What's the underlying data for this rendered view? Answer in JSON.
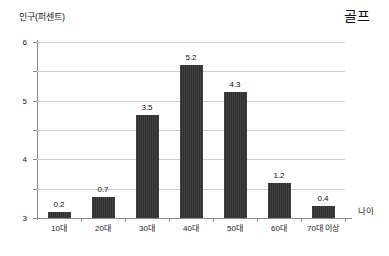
{
  "chart_data": {
    "type": "bar",
    "title": "골프",
    "subtitle": "",
    "xlabel": "나이",
    "ylabel": "인구(퍼센트)",
    "categories": [
      "10대",
      "20대",
      "30대",
      "40대",
      "50대",
      "60대",
      "70대 이상"
    ],
    "values": [
      0.2,
      0.7,
      3.5,
      5.2,
      4.3,
      1.2,
      0.4
    ],
    "value_labels": [
      "0.2",
      "0.7",
      "3.5",
      "5.2",
      "4.3",
      "1.2",
      "0.4"
    ],
    "ylim": [
      0,
      6
    ],
    "ytick_labels": [
      "0",
      "1",
      "2",
      "3",
      "4",
      "5",
      "6"
    ],
    "ytick_values": [
      0,
      1,
      2,
      3,
      4,
      5,
      6
    ],
    "grid": "horizontal",
    "legend": "none",
    "bar_color": "#2f2f2f",
    "gridline_color": "#cfcfcf",
    "axis_color": "#8a8a8a",
    "background_color": "#ffffff"
  }
}
